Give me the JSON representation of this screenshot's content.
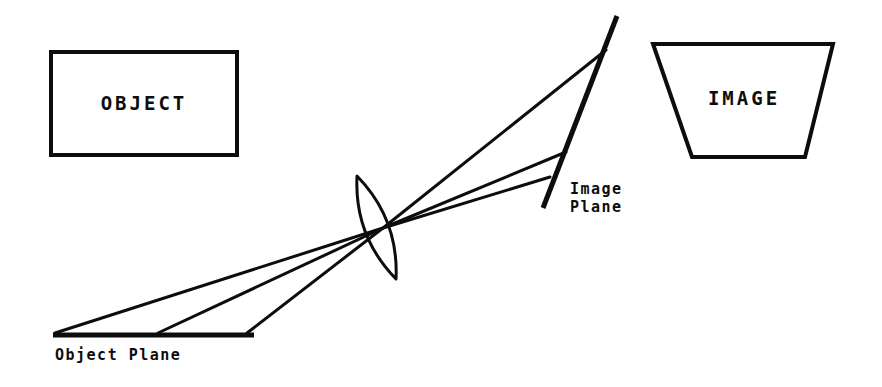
{
  "canvas": {
    "width": 882,
    "height": 387,
    "background": "#ffffff",
    "ink": "#0d0d0d"
  },
  "diagram": {
    "title_semantic": "optical-projection-keystone-diagram",
    "object_box": {
      "label": "OBJECT",
      "shape": "rectangle",
      "x": 51,
      "y": 52,
      "width": 186,
      "height": 103,
      "stroke_width": 4,
      "label_x": 144,
      "label_y": 110
    },
    "image_box": {
      "label": "IMAGE",
      "shape": "trapezoid",
      "points": "653,44 833,44 805,157 692,157",
      "stroke_width": 4,
      "label_x": 744,
      "label_y": 105
    },
    "object_plane": {
      "label": "Object Plane",
      "x1": 53,
      "y1": 335,
      "x2": 254,
      "y2": 335,
      "stroke_width": 5,
      "label_x": 55,
      "label_y": 360
    },
    "image_plane": {
      "label_line1": "Image",
      "label_line2": "Plane",
      "x1": 617,
      "y1": 16,
      "x2": 543,
      "y2": 208,
      "stroke_width": 5,
      "label_x": 570,
      "label_y": 194,
      "label2_x": 570,
      "label2_y": 212
    },
    "lens": {
      "name": "biconvex-lens",
      "top_x": 357,
      "top_y": 176,
      "bottom_x": 396,
      "bottom_y": 279,
      "stroke_width": 3,
      "bulge": 24
    },
    "node": {
      "x": 383,
      "y": 228
    },
    "rays": [
      {
        "name": "ray-upper",
        "object_x": 55,
        "object_y": 333,
        "image_x": 606,
        "image_y": 50,
        "stroke_width": 3
      },
      {
        "name": "ray-middle",
        "object_x": 158,
        "object_y": 333,
        "image_x": 566,
        "image_y": 152,
        "stroke_width": 3
      },
      {
        "name": "ray-lower",
        "object_x": 247,
        "object_y": 333,
        "image_x": 550,
        "image_y": 177,
        "stroke_width": 3
      }
    ]
  }
}
